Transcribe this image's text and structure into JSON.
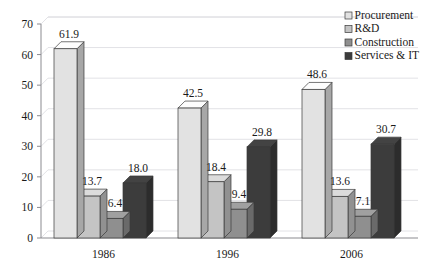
{
  "chart_data": {
    "type": "bar",
    "title": "",
    "subtitle": "",
    "xlabel": "",
    "ylabel": "",
    "categories": [
      "1986",
      "1996",
      "2006"
    ],
    "series": [
      {
        "name": "Procurement",
        "values": [
          61.9,
          42.5,
          48.6
        ],
        "color": "#e2e2e2"
      },
      {
        "name": "R&D",
        "values": [
          13.7,
          18.4,
          13.6
        ],
        "color": "#c4c4c4"
      },
      {
        "name": "Construction",
        "values": [
          6.4,
          9.4,
          7.1
        ],
        "color": "#8f8f8f"
      },
      {
        "name": "Services & IT",
        "values": [
          18.0,
          29.8,
          30.7
        ],
        "color": "#3c3c3c"
      }
    ],
    "ylim": [
      0,
      70
    ],
    "ytick_step": 10,
    "yticks": [
      "0",
      "10",
      "20",
      "30",
      "40",
      "50",
      "60",
      "70"
    ],
    "grid": true,
    "legend_position": "top-right",
    "value_label_format": "one-decimal",
    "three_d": true
  },
  "legend": {
    "items": [
      {
        "label": "Procurement"
      },
      {
        "label": "R&D"
      },
      {
        "label": "Construction"
      },
      {
        "label": "Services & IT"
      }
    ]
  },
  "style": {
    "background": "#ffffff",
    "grid_color": "#e2e2e6",
    "axis_color": "#8b8b90",
    "text_color": "#1a1a1a",
    "bar_outline": "#3a3a3a"
  }
}
